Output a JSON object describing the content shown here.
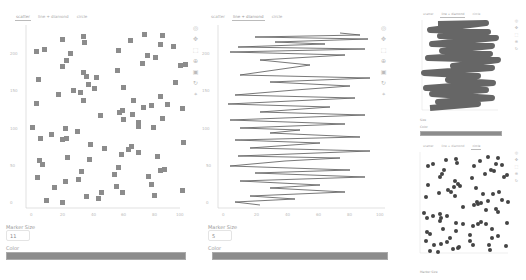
{
  "tabs": [
    "scatter",
    "line + diamond",
    "circle"
  ],
  "panels": [
    {
      "active_tab": 0,
      "marker_size_label": "Marker Size",
      "marker_size_value": "11",
      "color_label": "Color",
      "color_value": "#8c8c8c"
    },
    {
      "active_tab": 1,
      "marker_size_label": "Marker Size",
      "marker_size_value": "5",
      "color_label": "Color",
      "color_value": "#8c8c8c"
    },
    {
      "active_tab": 1,
      "marker_size_label": "Size",
      "color_label": "Color",
      "color_value": "#8c8c8c"
    },
    {
      "active_tab": 2,
      "marker_size_label": "Marker Size"
    }
  ],
  "axes": {
    "x_ticks": [
      "0",
      "20",
      "40",
      "60",
      "80",
      "100"
    ],
    "y_ticks": [
      "0",
      "50",
      "100",
      "150",
      "200"
    ]
  },
  "toolbar_icons": [
    "bokeh-logo-icon",
    "pan-icon",
    "box-zoom-icon",
    "wheel-zoom-icon",
    "save-icon",
    "reset-icon",
    "hover-icon"
  ]
}
